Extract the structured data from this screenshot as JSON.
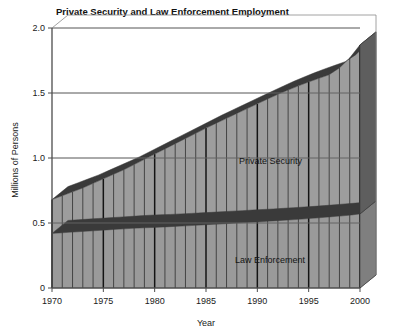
{
  "chart_data": {
    "type": "area",
    "title": "Private Security and Law Enforcement Employment",
    "xlabel": "Year",
    "ylabel": "Millions of Persons",
    "xlim": [
      1970,
      2000
    ],
    "ylim": [
      0,
      2.0
    ],
    "grid": true,
    "stacked": true,
    "three_d": true,
    "legend_position": "inline-annotation",
    "ytick_labels": [
      "0",
      "0.5",
      "1.0",
      "1.5",
      "2.0"
    ],
    "ytick_values": [
      0,
      0.5,
      1.0,
      1.5,
      2.0
    ],
    "xtick_labels": [
      "1970",
      "1975",
      "1980",
      "1985",
      "1990",
      "1995",
      "2000"
    ],
    "xtick_values": [
      1970,
      1975,
      1980,
      1985,
      1990,
      1995,
      2000
    ],
    "x": [
      1970,
      1971,
      1972,
      1973,
      1974,
      1975,
      1976,
      1977,
      1978,
      1979,
      1980,
      1981,
      1982,
      1983,
      1984,
      1985,
      1986,
      1987,
      1988,
      1989,
      1990,
      1991,
      1992,
      1993,
      1994,
      1995,
      1996,
      1997,
      1998,
      1999,
      2000
    ],
    "series": [
      {
        "name": "Law Enforcement",
        "values": [
          0.42,
          0.425,
          0.43,
          0.435,
          0.44,
          0.445,
          0.45,
          0.455,
          0.46,
          0.463,
          0.466,
          0.47,
          0.474,
          0.478,
          0.482,
          0.487,
          0.491,
          0.495,
          0.5,
          0.504,
          0.508,
          0.513,
          0.518,
          0.523,
          0.528,
          0.534,
          0.54,
          0.547,
          0.553,
          0.56,
          0.57
        ],
        "annotation": "Law Enforcement"
      },
      {
        "name": "Private Security",
        "values": [
          0.26,
          0.285,
          0.31,
          0.335,
          0.365,
          0.395,
          0.425,
          0.455,
          0.49,
          0.527,
          0.564,
          0.6,
          0.636,
          0.672,
          0.708,
          0.743,
          0.777,
          0.81,
          0.843,
          0.876,
          0.909,
          0.941,
          0.972,
          1.0,
          1.027,
          1.051,
          1.073,
          1.094,
          1.14,
          1.21,
          1.3
        ],
        "annotation": "Private Security"
      }
    ],
    "totals": [
      0.68,
      0.71,
      0.74,
      0.77,
      0.805,
      0.84,
      0.875,
      0.91,
      0.95,
      0.99,
      1.03,
      1.07,
      1.11,
      1.15,
      1.19,
      1.23,
      1.268,
      1.305,
      1.343,
      1.38,
      1.417,
      1.454,
      1.49,
      1.523,
      1.555,
      1.585,
      1.613,
      1.641,
      1.693,
      1.77,
      1.87
    ]
  },
  "colors": {
    "fill": "#9d9d9d",
    "fill_lower": "#9a9a9a",
    "top_face": "#3a3a3a",
    "side_face": "#4a4a4a",
    "divider": "#2f2f2f",
    "divider_major": "#141414",
    "axis": "#4c4c4c",
    "grid": "#6d6d6d",
    "text": "#1a1a1a",
    "background": "#ffffff"
  }
}
